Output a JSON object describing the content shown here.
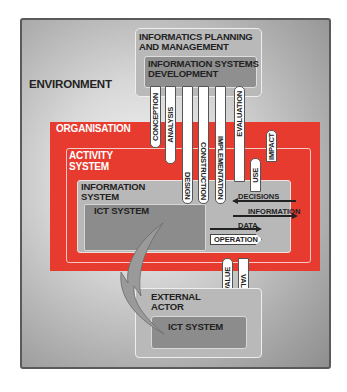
{
  "diagram": {
    "environment": {
      "label": "ENVIRONMENT"
    },
    "informatics_planning": {
      "label": "INFORMATICS PLANNING\nAND MANAGEMENT"
    },
    "is_development": {
      "label": "INFORMATION SYSTEMS\nDEVELOPMENT",
      "phases": [
        "CONCEPTION",
        "ANALYSIS",
        "DESIGN",
        "CONSTRUCTION",
        "IMPLEMENTATION",
        "EVALUATION"
      ]
    },
    "organisation": {
      "label": "ORGANISATION"
    },
    "activity_system": {
      "label": "ACTIVITY\nSYSTEM"
    },
    "information_system": {
      "label": "INFORMATION\nSYSTEM"
    },
    "ict_system": {
      "label": "ICT SYSTEM"
    },
    "feedback": [
      "USE",
      "IMPACT"
    ],
    "flows": [
      {
        "label": "DECISIONS",
        "direction": "left"
      },
      {
        "label": "INFORMATION",
        "direction": "right"
      },
      {
        "label": "DATA",
        "direction": "right"
      },
      {
        "label": "OPERATION",
        "direction": "right"
      }
    ],
    "value_links": [
      "VALUE",
      "VALUE"
    ],
    "external_actor": {
      "label": "EXTERNAL\nACTOR",
      "ict_system": "ICT SYSTEM"
    },
    "colors": {
      "organisation_red": "#e63b2e",
      "box_gray": "#b9b9b9",
      "ict_dark_gray": "#8c8c8c"
    }
  }
}
